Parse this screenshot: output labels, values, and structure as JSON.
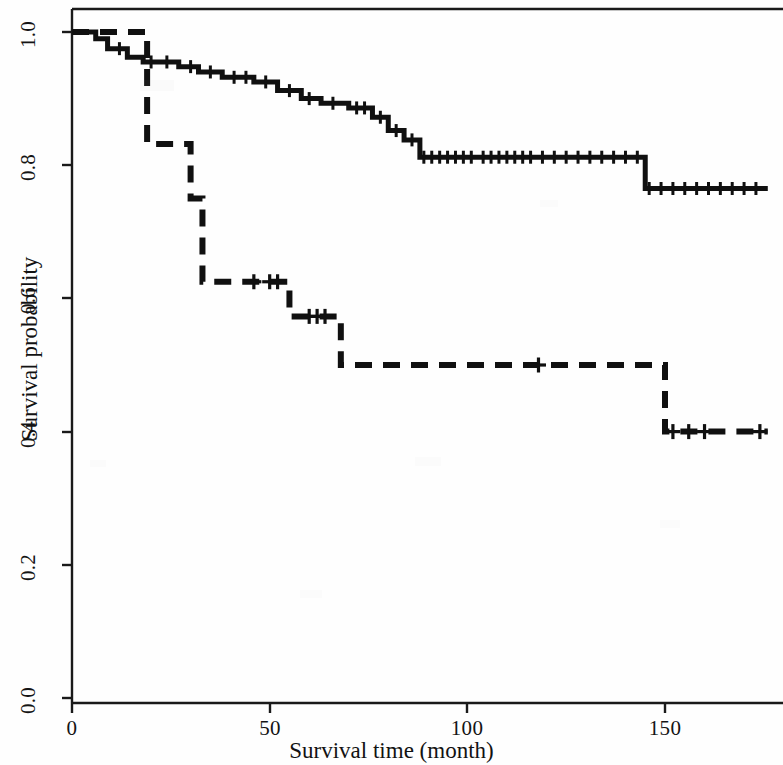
{
  "chart_data": {
    "type": "line",
    "subtype": "kaplan-meier-survival",
    "title": "",
    "xlabel": "Survival time (month)",
    "ylabel": "Survival probability",
    "xlim": [
      0,
      178
    ],
    "ylim": [
      0.0,
      1.02
    ],
    "xticks": [
      0,
      50,
      100,
      150
    ],
    "xtick_labels": [
      "0",
      "50",
      "100",
      "150"
    ],
    "yticks": [
      0.0,
      0.2,
      0.4,
      0.6,
      0.8,
      1.0
    ],
    "ytick_labels": [
      "0.0",
      "0.2",
      "0.4",
      "0.6",
      "0.8",
      "1.0"
    ],
    "grid": false,
    "legend": "none",
    "axis_style": "box-top-left-bottom",
    "line_color": "#101010",
    "series": [
      {
        "name": "group-1-solid",
        "style": "solid",
        "linewidth": 5,
        "steps": [
          [
            0,
            1.0
          ],
          [
            6,
            1.0
          ],
          [
            6,
            0.99
          ],
          [
            9,
            0.99
          ],
          [
            9,
            0.975
          ],
          [
            14,
            0.975
          ],
          [
            14,
            0.962
          ],
          [
            18,
            0.962
          ],
          [
            18,
            0.955
          ],
          [
            27,
            0.955
          ],
          [
            27,
            0.948
          ],
          [
            32,
            0.948
          ],
          [
            32,
            0.94
          ],
          [
            38,
            0.94
          ],
          [
            38,
            0.932
          ],
          [
            46,
            0.932
          ],
          [
            46,
            0.925
          ],
          [
            52,
            0.925
          ],
          [
            52,
            0.912
          ],
          [
            58,
            0.912
          ],
          [
            58,
            0.9
          ],
          [
            63,
            0.9
          ],
          [
            63,
            0.893
          ],
          [
            70,
            0.893
          ],
          [
            70,
            0.886
          ],
          [
            76,
            0.886
          ],
          [
            76,
            0.872
          ],
          [
            80,
            0.872
          ],
          [
            80,
            0.852
          ],
          [
            84,
            0.852
          ],
          [
            84,
            0.838
          ],
          [
            88,
            0.838
          ],
          [
            88,
            0.812
          ],
          [
            145,
            0.812
          ],
          [
            145,
            0.765
          ],
          [
            176,
            0.765
          ]
        ],
        "censor_times": [
          12,
          20,
          24,
          30,
          35,
          41,
          44,
          49,
          55,
          60,
          66,
          72,
          74,
          78,
          82,
          86,
          89,
          91,
          93,
          95,
          97,
          99,
          101,
          104,
          106,
          108,
          110,
          112,
          114,
          116,
          119,
          122,
          125,
          128,
          131,
          134,
          137,
          140,
          143,
          146,
          149,
          152,
          155,
          158,
          161,
          164,
          167,
          170,
          173
        ]
      },
      {
        "name": "group-2-dashed",
        "style": "dashed",
        "linewidth": 6,
        "dash_pattern": "17 11",
        "steps": [
          [
            0,
            1.0
          ],
          [
            19,
            1.0
          ],
          [
            19,
            0.832
          ],
          [
            30,
            0.832
          ],
          [
            30,
            0.75
          ],
          [
            33,
            0.75
          ],
          [
            33,
            0.625
          ],
          [
            40,
            0.625
          ],
          [
            40,
            0.625
          ],
          [
            55,
            0.625
          ],
          [
            55,
            0.573
          ],
          [
            68,
            0.573
          ],
          [
            68,
            0.5
          ],
          [
            150,
            0.5
          ],
          [
            150,
            0.4
          ],
          [
            176,
            0.4
          ]
        ],
        "censor_times": [
          46,
          50,
          52,
          60,
          62,
          64,
          118,
          152,
          156,
          160,
          174
        ]
      }
    ]
  },
  "axes": {
    "y_tick_labels": [
      "1.0",
      "0.8",
      "0.6",
      "0.4",
      "0.2",
      "0.0"
    ],
    "x_tick_labels": [
      "0",
      "50",
      "100",
      "150"
    ]
  }
}
